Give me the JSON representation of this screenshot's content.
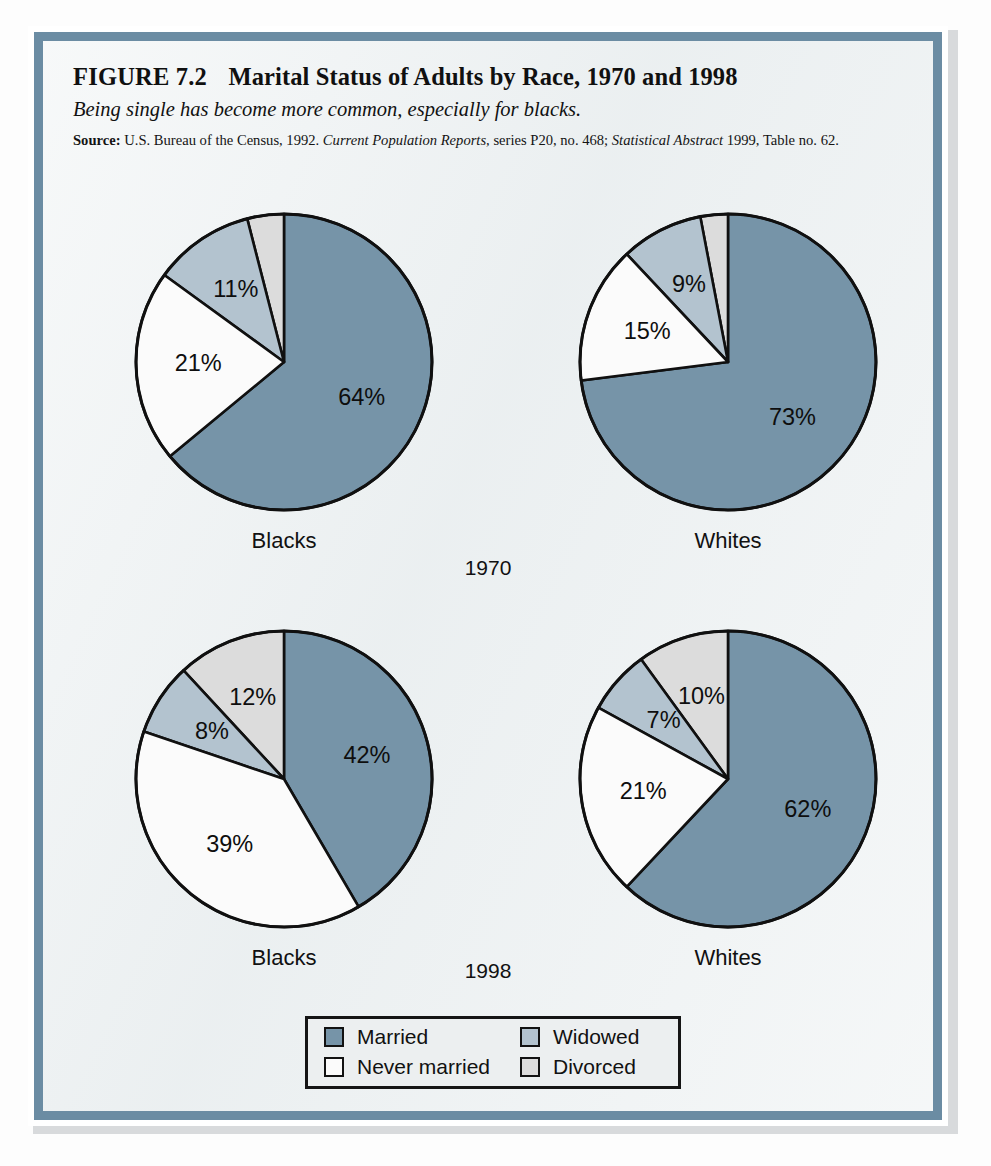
{
  "figure": {
    "number_label": "FIGURE 7.2",
    "title": "Marital Status of Adults by Race, 1970 and 1998",
    "subtitle": "Being single has become more common, especially for blacks.",
    "source": {
      "label": "Source:",
      "text_part1": "U.S. Bureau of the Census, 1992.",
      "italic1": "Current Population Reports,",
      "text_part2": "series P20, no. 468;",
      "italic2": "Statistical Abstract",
      "text_part3": "1999, Table no. 62."
    }
  },
  "colors": {
    "married": "#7694a8",
    "never_married": "#fbfbfb",
    "widowed": "#b3c3cf",
    "divorced": "#dcdcdc",
    "stroke": "#101010",
    "frame_border": "#6b8ca3",
    "panel_background": "#edf1f2"
  },
  "years": {
    "year_1970": "1970",
    "year_1998": "1998"
  },
  "groups": {
    "blacks": "Blacks",
    "whites": "Whites"
  },
  "legend": {
    "entries": [
      {
        "label": "Married",
        "color": "#7694a8",
        "name": "married"
      },
      {
        "label": "Widowed",
        "color": "#b3c3cf",
        "name": "widowed"
      },
      {
        "label": "Never married",
        "color": "#fbfbfb",
        "name": "never-married"
      },
      {
        "label": "Divorced",
        "color": "#dcdcdc",
        "name": "divorced"
      }
    ]
  },
  "chart_data": [
    {
      "type": "pie",
      "title": "Blacks, 1970",
      "group": "Blacks",
      "year": "1970",
      "categories": [
        "Married",
        "Never married",
        "Widowed",
        "Divorced"
      ],
      "values": [
        64,
        21,
        11,
        4
      ],
      "labels": [
        "64%",
        "21%",
        "11%",
        "4%"
      ],
      "colors": [
        "#7694a8",
        "#fbfbfb",
        "#b3c3cf",
        "#dcdcdc"
      ],
      "start_angle_deg": 0,
      "direction": "married-clockwise-others-counterclockwise",
      "legend_position": "bottom-center"
    },
    {
      "type": "pie",
      "title": "Whites, 1970",
      "group": "Whites",
      "year": "1970",
      "categories": [
        "Married",
        "Never married",
        "Widowed",
        "Divorced"
      ],
      "values": [
        73,
        15,
        9,
        3
      ],
      "labels": [
        "73%",
        "15%",
        "9%",
        "3%"
      ],
      "colors": [
        "#7694a8",
        "#fbfbfb",
        "#b3c3cf",
        "#dcdcdc"
      ],
      "start_angle_deg": 0,
      "direction": "married-clockwise-others-counterclockwise",
      "legend_position": "bottom-center"
    },
    {
      "type": "pie",
      "title": "Blacks, 1998",
      "group": "Blacks",
      "year": "1998",
      "categories": [
        "Married",
        "Never married",
        "Widowed",
        "Divorced"
      ],
      "values": [
        42,
        39,
        8,
        12
      ],
      "labels": [
        "42%",
        "39%",
        "8%",
        "12%"
      ],
      "colors": [
        "#7694a8",
        "#fbfbfb",
        "#b3c3cf",
        "#dcdcdc"
      ],
      "start_angle_deg": 0,
      "direction": "married-clockwise-others-counterclockwise",
      "legend_position": "bottom-center"
    },
    {
      "type": "pie",
      "title": "Whites, 1998",
      "group": "Whites",
      "year": "1998",
      "categories": [
        "Married",
        "Never married",
        "Widowed",
        "Divorced"
      ],
      "values": [
        62,
        21,
        7,
        10
      ],
      "labels": [
        "62%",
        "21%",
        "7%",
        "10%"
      ],
      "colors": [
        "#7694a8",
        "#fbfbfb",
        "#b3c3cf",
        "#dcdcdc"
      ],
      "start_angle_deg": 0,
      "direction": "married-clockwise-others-counterclockwise",
      "legend_position": "bottom-center"
    }
  ]
}
